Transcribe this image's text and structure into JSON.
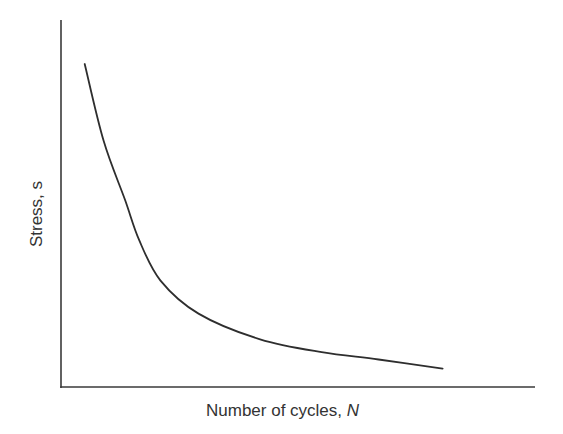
{
  "chart_data": {
    "type": "line",
    "title": "",
    "xlabel": "Number of cycles, N",
    "ylabel": "Stress, s",
    "xlabel_parts": {
      "text": "Number of cycles, ",
      "var": "N"
    },
    "ylabel_parts": {
      "text": "Stress, ",
      "var": "s"
    },
    "x_ticks": [],
    "y_ticks": [],
    "grid": false,
    "legend": null,
    "series": [
      {
        "name": "S-N curve",
        "color": "#2e2e2e",
        "points_normalized": [
          {
            "x": 0.05,
            "y": 0.88
          },
          {
            "x": 0.09,
            "y": 0.67
          },
          {
            "x": 0.135,
            "y": 0.51
          },
          {
            "x": 0.165,
            "y": 0.4
          },
          {
            "x": 0.21,
            "y": 0.29
          },
          {
            "x": 0.29,
            "y": 0.2
          },
          {
            "x": 0.42,
            "y": 0.13
          },
          {
            "x": 0.55,
            "y": 0.095
          },
          {
            "x": 0.67,
            "y": 0.075
          },
          {
            "x": 0.805,
            "y": 0.05
          }
        ]
      }
    ]
  },
  "axes": {
    "x_label": {
      "text": "Number of cycles, ",
      "var": "N"
    },
    "y_label": {
      "text": "Stress, ",
      "var": "s"
    }
  }
}
